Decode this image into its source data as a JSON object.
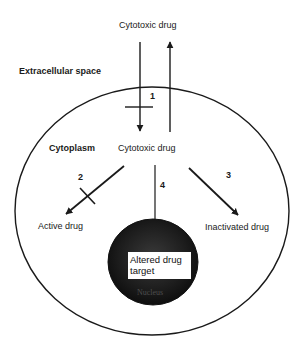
{
  "diagram": {
    "labels": {
      "extracellular": "Extracellular space",
      "cytoplasm": "Cytoplasm",
      "drug_outside": "Cytotoxic drug",
      "drug_inside": "Cytotoxic drug",
      "active": "Active drug",
      "inactivated": "Inactivated drug",
      "target_line1": "Altered drug",
      "target_line2": "target",
      "nucleus": "Nucleus"
    },
    "pathways": [
      {
        "number": "1",
        "description": "Drug uptake (blocked) / efflux"
      },
      {
        "number": "2",
        "description": "Activation (blocked)"
      },
      {
        "number": "3",
        "description": "Inactivation"
      },
      {
        "number": "4",
        "description": "Altered drug target"
      }
    ],
    "colors": {
      "line": "#1a1a1a",
      "nucleus": "#1e1e1e",
      "background": "#ffffff"
    }
  }
}
